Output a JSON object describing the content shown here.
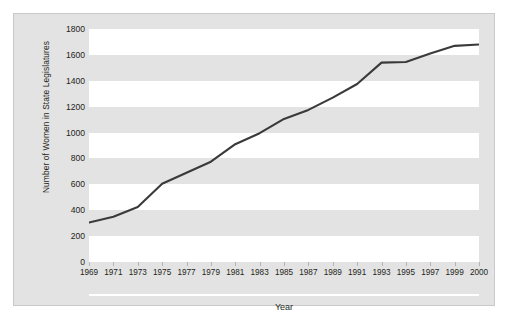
{
  "chart_data": {
    "type": "line",
    "title": "",
    "xlabel": "Year",
    "ylabel": "Number of Women in State Legislatures",
    "categories": [
      "1969",
      "1971",
      "1973",
      "1975",
      "1977",
      "1979",
      "1981",
      "1983",
      "1985",
      "1987",
      "1989",
      "1991",
      "1993",
      "1995",
      "1997",
      "1999",
      "2000"
    ],
    "values": [
      305,
      350,
      425,
      605,
      690,
      775,
      910,
      995,
      1105,
      1175,
      1270,
      1375,
      1540,
      1545,
      1610,
      1670,
      1680
    ],
    "series": [
      {
        "name": "Number of Women in State Legislatures",
        "values": [
          305,
          350,
          425,
          605,
          690,
          775,
          910,
          995,
          1105,
          1175,
          1270,
          1375,
          1540,
          1545,
          1610,
          1670,
          1680
        ]
      }
    ],
    "ylim": [
      0,
      1800
    ],
    "yticks": [
      "0",
      "200",
      "400",
      "600",
      "800",
      "1000",
      "1200",
      "1400",
      "1600",
      "1800"
    ],
    "ytick_values": [
      0,
      200,
      400,
      600,
      800,
      1000,
      1200,
      1400,
      1600,
      1800
    ],
    "xlim": [
      "1969",
      "2000"
    ],
    "grid": false,
    "banded_background": true,
    "legend": "none",
    "line_color": "#3a3a3a",
    "band_color": "#ffffff",
    "figure_background": "#e3e3e3",
    "text_color": "#231f20"
  }
}
